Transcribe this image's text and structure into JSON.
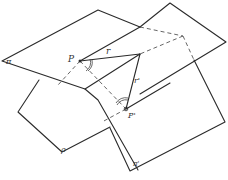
{
  "diagram": {
    "labels": {
      "point_p": "P",
      "point_p_prime": "P'",
      "segment_r": "r",
      "segment_r_prime": "r'",
      "plane_pi": "π",
      "plane_rho": "ρ",
      "plane_pi_prime": "π'"
    },
    "colors": {
      "line": "#2a2a2a",
      "background": "#ffffff"
    }
  }
}
